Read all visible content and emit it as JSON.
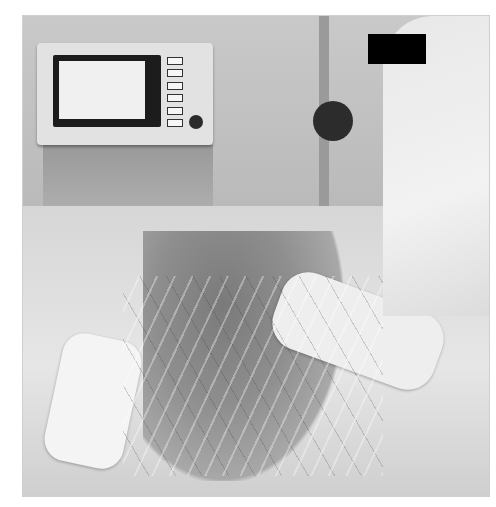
{
  "image": {
    "type": "photograph",
    "tone": "grayscale",
    "description": "Hospital intensive care scene: medical monitor on a cart in the upper left, a caregiver on the right with a black privacy bar over the face, and a bed with padding and many cables and lines.",
    "regions": [
      {
        "name": "medical-monitor",
        "label": "Patient monitor with screen and side buttons"
      },
      {
        "name": "equipment-cart",
        "label": "Equipment cart beneath monitor"
      },
      {
        "name": "iv-pole",
        "label": "IV pole"
      },
      {
        "name": "caregiver",
        "label": "Caregiver in white uniform"
      },
      {
        "name": "privacy-bar",
        "label": "Black privacy bar"
      },
      {
        "name": "bed",
        "label": "Hospital bed with bedding"
      },
      {
        "name": "patient-area",
        "label": "Patient area on bed"
      },
      {
        "name": "cables",
        "label": "Medical tubes and monitoring cables"
      }
    ]
  },
  "colors": {
    "background": "#ffffff",
    "privacy_bar": "#000000",
    "bedding": "#e6e6e6",
    "monitor_body": "#e2e2e2"
  }
}
